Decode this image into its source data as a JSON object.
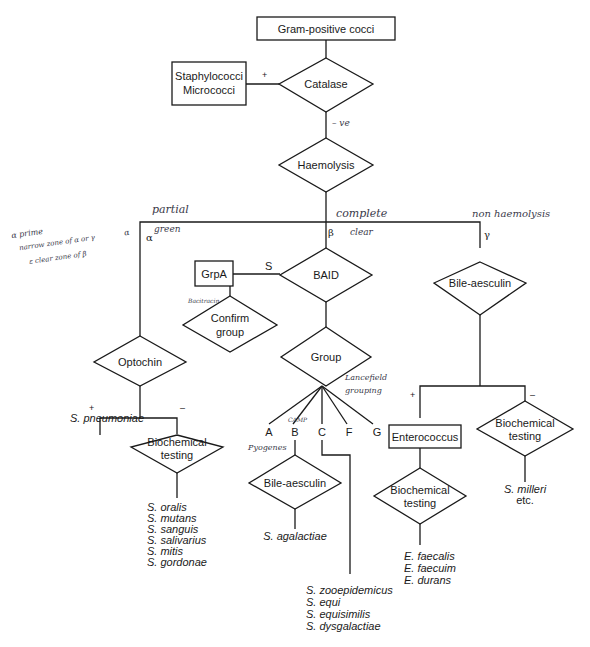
{
  "diagram": {
    "nodes": {
      "root": "Gram-positive cocci",
      "staph_line1": "Staphylococci",
      "staph_line2": "Micrococci",
      "catalase": "Catalase",
      "haemolysis": "Haemolysis",
      "grpa": "GrpA",
      "baid": "BAID",
      "confirm_line1": "Confirm",
      "confirm_line2": "group",
      "group": "Group",
      "optochin": "Optochin",
      "bile1": "Bile-aesculin",
      "bile2": "Bile-aesculin",
      "enterococcus": "Enterococcus",
      "biochem1_line1": "Biochemical",
      "biochem1_line2": "testing",
      "biochem2_line1": "Biochemical",
      "biochem2_line2": "testing",
      "biochem3_line1": "Biochemical",
      "biochem3_line2": "testing"
    },
    "edge_labels": {
      "catalase_pos": "+",
      "catalase_neg": "– ve",
      "alpha": "α",
      "beta": "β",
      "gamma": "γ",
      "baid_s": "S",
      "optochin_pos": "+",
      "optochin_neg": "–",
      "bile_pos": "+",
      "bile_neg": "–"
    },
    "groups": [
      "A",
      "B",
      "C",
      "F",
      "G"
    ],
    "results": {
      "pneumoniae": "S. pneumoniae",
      "viridans": [
        "S. oralis",
        "S. mutans",
        "S. sanguis",
        "S. salivarius",
        "S. mitis",
        "S. gordonae"
      ],
      "agalactiae": "S. agalactiae",
      "group_c": [
        "S. zooepidemicus",
        "S. equi",
        "S. equisimilis",
        "S. dysgalactiae"
      ],
      "enterococci": [
        "E. faecalis",
        "E. faecuim",
        "E. durans"
      ],
      "milleri_line1": "S. milleri",
      "milleri_line2": "etc."
    },
    "handwritten": {
      "partial": "partial",
      "green": "green",
      "complete": "complete",
      "clear": "clear",
      "non_haemolysis": "non haemolysis",
      "note1": "α prime",
      "note2": "narrow zone of α or γ",
      "note2_suffix": "α",
      "note3": "ε clear zone of β",
      "bacitracin": "Bacitracin",
      "lancefield1": "Lancefield",
      "lancefield2": "grouping",
      "camp": "CAMP",
      "pyogenes": "Pyogenes"
    }
  }
}
